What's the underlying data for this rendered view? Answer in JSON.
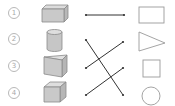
{
  "diagram": {
    "type": "matching",
    "left_items": [
      {
        "label": "1",
        "solid": "rectangular-prism"
      },
      {
        "label": "2",
        "solid": "cylinder"
      },
      {
        "label": "3",
        "solid": "triangular-prism"
      },
      {
        "label": "4",
        "solid": "cube"
      }
    ],
    "right_items": [
      {
        "shape": "rectangle"
      },
      {
        "shape": "triangle"
      },
      {
        "shape": "square"
      },
      {
        "shape": "circle"
      }
    ],
    "connections": [
      {
        "from": "1",
        "to": "rectangle"
      },
      {
        "from": "2",
        "to": "circle"
      },
      {
        "from": "3",
        "to": "triangle"
      },
      {
        "from": "4",
        "to": "square"
      }
    ],
    "colors": {
      "line": "#333333",
      "shape_fill": "#c9c9c9",
      "shape_stroke": "#8a8a8a",
      "outline": "#9a9a9a",
      "number": "#a8a8a8"
    }
  }
}
